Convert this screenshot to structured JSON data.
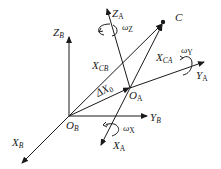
{
  "diagram": {
    "frame_B": {
      "origin": {
        "main": "O",
        "sub": "B"
      },
      "x_axis": {
        "main": "X",
        "sub": "B"
      },
      "y_axis": {
        "main": "Y",
        "sub": "B"
      },
      "z_axis": {
        "main": "Z",
        "sub": "B"
      }
    },
    "frame_A": {
      "origin": {
        "main": "O",
        "sub": "A"
      },
      "x_axis": {
        "main": "X",
        "sub": "A"
      },
      "y_axis": {
        "main": "Y",
        "sub": "A"
      },
      "z_axis": {
        "main": "Z",
        "sub": "A"
      }
    },
    "point_C": "C",
    "vectors": {
      "x_cb": {
        "main": "X",
        "sub": "CB"
      },
      "x_ca": {
        "main": "X",
        "sub": "CA"
      },
      "delta_x0": {
        "main": "ΔX",
        "sub": "0"
      }
    },
    "rotations": {
      "omega_x": {
        "main": "ω",
        "sub": "X"
      },
      "omega_y": {
        "main": "ω",
        "sub": "Y"
      },
      "omega_z": {
        "main": "ω",
        "sub": "Z"
      }
    }
  }
}
